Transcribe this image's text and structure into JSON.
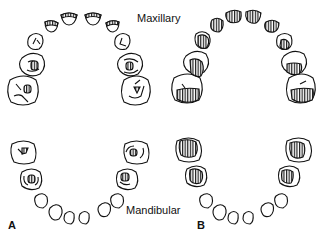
{
  "labels": {
    "maxillary": "Maxillary",
    "mandibular": "Mandibular",
    "panel_a": "A",
    "panel_b": "B"
  },
  "colors": {
    "line": "#111111",
    "background": "#ffffff"
  }
}
